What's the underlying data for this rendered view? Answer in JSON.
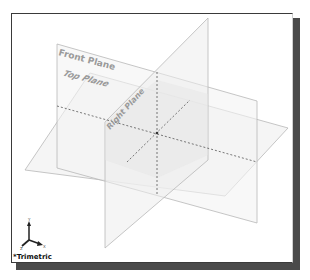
{
  "viewport": {
    "view_orientation": "*Trimetric",
    "planes": [
      {
        "name": "Front Plane",
        "label": "Front Plane"
      },
      {
        "name": "Top Plane",
        "label": "Top Plane"
      },
      {
        "name": "Right Plane",
        "label": "Right Plane"
      }
    ],
    "triad": {
      "x_label": "X",
      "y_label": "Y",
      "z_label": "Z"
    }
  },
  "colors": {
    "plane_edge": "#b5b5b5",
    "plane_fill": "#f2f2f2",
    "label": "#9a9a9a",
    "frame_shadow": "#4a4a4a"
  }
}
